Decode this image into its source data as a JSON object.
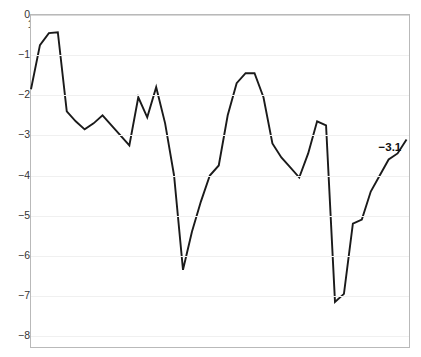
{
  "chart_data": {
    "type": "line",
    "title": "",
    "subtitle": "",
    "xlabel": "",
    "ylabel": "",
    "xlim": [
      1977,
      2019.5
    ],
    "ylim": [
      -8,
      0
    ],
    "grid": true,
    "legend": false,
    "legend_position": "none",
    "line_color": "#1a1a1a",
    "background_color": "#ffffff",
    "gridline_color": "#f0f0f0",
    "axis_color": "#b9b9b9",
    "y_ticks": [
      0,
      -1,
      -2,
      -3,
      -4,
      -5,
      -6,
      -7,
      -8
    ],
    "y_tick_labels": [
      "0",
      "−1",
      "−2",
      "−3",
      "−4",
      "−5",
      "−6",
      "−7",
      "−8"
    ],
    "x_ticks": [
      1978,
      1982,
      1986,
      1990,
      1994,
      1998,
      2002,
      2006,
      2010,
      2014,
      2018
    ],
    "x_tick_labels": [
      "1978",
      "1982",
      "1986",
      "1990",
      "1994",
      "1998",
      "2002",
      "2006",
      "2010",
      "2014",
      "2018"
    ],
    "x": [
      1977,
      1978,
      1979,
      1980,
      1981,
      1982,
      1983,
      1984,
      1985,
      1986,
      1987,
      1988,
      1989,
      1990,
      1991,
      1992,
      1993,
      1994,
      1995,
      1996,
      1997,
      1998,
      1999,
      2000,
      2001,
      2002,
      2003,
      2004,
      2005,
      2006,
      2007,
      2008,
      2009,
      2010,
      2011,
      2012,
      2013,
      2014,
      2015,
      2016,
      2017,
      2018,
      2019
    ],
    "values": [
      -1.85,
      -0.75,
      -0.45,
      -0.43,
      -2.4,
      -2.65,
      -2.85,
      -2.7,
      -2.5,
      -2.75,
      -3.0,
      -3.25,
      -2.05,
      -2.55,
      -1.8,
      -2.7,
      -4.0,
      -6.35,
      -5.4,
      -4.65,
      -4.0,
      -3.75,
      -2.5,
      -1.7,
      -1.45,
      -1.45,
      -2.05,
      -3.2,
      -3.55,
      -3.8,
      -4.05,
      -3.45,
      -2.65,
      -2.75,
      -7.15,
      -6.95,
      -5.2,
      -5.1,
      -4.4,
      -4.0,
      -3.6,
      -3.45,
      -3.1
    ],
    "annotations": [
      {
        "text": "−3.1",
        "x": 2019,
        "y": -3.1,
        "bold": true
      }
    ],
    "end_value_label": "−3.1"
  }
}
